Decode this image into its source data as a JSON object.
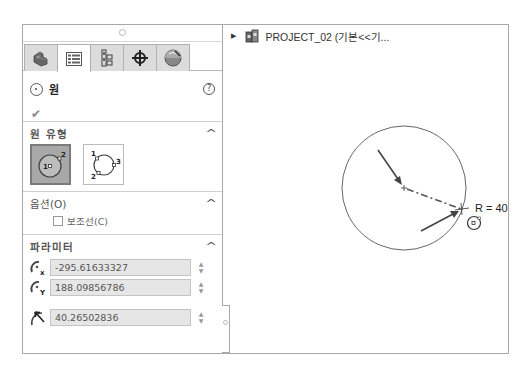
{
  "property_manager": {
    "tabs": [
      {
        "name": "feature-manager",
        "active": false
      },
      {
        "name": "property-manager",
        "active": true
      },
      {
        "name": "configuration-manager",
        "active": false
      },
      {
        "name": "dimxpert-manager",
        "active": false
      },
      {
        "name": "display-manager",
        "active": false
      }
    ],
    "title": "원",
    "help_glyph": "?",
    "ok_glyph": "✔",
    "sections": {
      "circle_type": {
        "title": "원 유형",
        "types": [
          {
            "name": "center-circle",
            "selected": true,
            "labels": [
              "1",
              "2"
            ]
          },
          {
            "name": "perimeter-circle",
            "selected": false,
            "labels": [
              "1",
              "2",
              "3"
            ]
          }
        ]
      },
      "options": {
        "title": "옵션(O)",
        "construction_label": "보조선(C)",
        "construction_checked": false
      },
      "parameters": {
        "title": "파라미터",
        "center_x": "-295.61633327",
        "center_y": "188.09856786",
        "radius": "40.26502836"
      }
    },
    "caret_glyph": "^",
    "spin_up": "▲",
    "spin_down": "▼"
  },
  "feature_tree": {
    "expand_glyph": "▶",
    "label": "PROJECT_02  (기본<<기..."
  },
  "sketch": {
    "circle": {
      "cx": 181,
      "cy": 163,
      "r": 62
    },
    "radius_label": "R = 40.27",
    "colors": {
      "line": "#666666",
      "arrow": "#444444"
    }
  }
}
